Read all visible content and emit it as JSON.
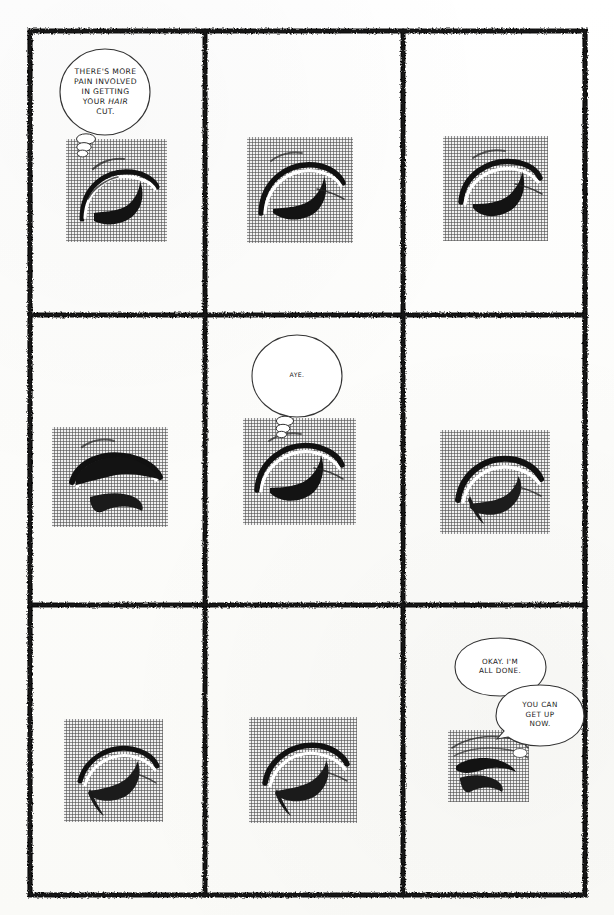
{
  "page": {
    "kind": "comic-page",
    "rows": 3,
    "columns": 3,
    "panel_count": 9,
    "ink_color": "#111111",
    "paper_color": "#fdfdfb",
    "halftone_gray": "#b4b4b4"
  },
  "panels": [
    {
      "id": "panel-1",
      "position": "row-1-col-1",
      "has_image": true,
      "balloons": [
        "balloon-1"
      ]
    },
    {
      "id": "panel-2",
      "position": "row-1-col-2",
      "has_image": true,
      "balloons": []
    },
    {
      "id": "panel-3",
      "position": "row-1-col-3",
      "has_image": true,
      "balloons": []
    },
    {
      "id": "panel-4",
      "position": "row-2-col-1",
      "has_image": true,
      "balloons": []
    },
    {
      "id": "panel-5",
      "position": "row-2-col-2",
      "has_image": true,
      "balloons": [
        "balloon-2"
      ]
    },
    {
      "id": "panel-6",
      "position": "row-2-col-3",
      "has_image": true,
      "balloons": []
    },
    {
      "id": "panel-7",
      "position": "row-3-col-1",
      "has_image": true,
      "balloons": []
    },
    {
      "id": "panel-8",
      "position": "row-3-col-2",
      "has_image": true,
      "balloons": []
    },
    {
      "id": "panel-9",
      "position": "row-3-col-3",
      "has_image": true,
      "balloons": [
        "balloon-3",
        "balloon-4"
      ]
    }
  ],
  "balloons": {
    "balloon_1": {
      "panel": "panel-1",
      "lines": [
        {
          "text": "THERE'S MORE",
          "italic": false
        },
        {
          "text": "PAIN INVOLVED",
          "italic": false
        },
        {
          "text": "IN GETTING",
          "italic": false
        },
        {
          "text": "YOUR ",
          "italic": false,
          "emphasis": "HAIR"
        },
        {
          "text": "CUT.",
          "italic": false
        }
      ],
      "plain_text": "THERE'S MORE PAIN INVOLVED IN GETTING YOUR HAIR CUT.",
      "emphasized_word": "HAIR",
      "tail": "stacked-ellipses"
    },
    "balloon_2": {
      "panel": "panel-5",
      "lines": [
        {
          "text": "AYE.",
          "italic": false
        }
      ],
      "plain_text": "AYE.",
      "tail": "stacked-ellipses"
    },
    "balloon_3": {
      "panel": "panel-9",
      "lines": [
        {
          "text": "OKAY. I'M",
          "italic": false
        },
        {
          "text": "ALL DONE.",
          "italic": false
        }
      ],
      "plain_text": "OKAY. I'M ALL DONE.",
      "tail": "pointer"
    },
    "balloon_4": {
      "panel": "panel-9",
      "lines": [
        {
          "text": "YOU CAN",
          "italic": false
        },
        {
          "text": "GET UP",
          "italic": false
        },
        {
          "text": "NOW.",
          "italic": false
        }
      ],
      "plain_text": "YOU CAN GET UP NOW.",
      "tail": "pointer"
    }
  }
}
